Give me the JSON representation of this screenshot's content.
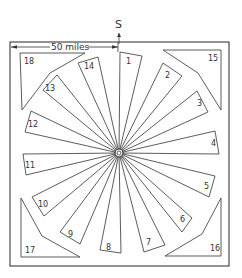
{
  "diagram": {
    "north_label": "S",
    "scale_label": "50 miles",
    "center": [
      119,
      153
    ],
    "frame": {
      "x": 10,
      "y": 42,
      "w": 219,
      "h": 224
    },
    "sectors": [
      {
        "id": "1",
        "label": "1",
        "outer": [
          [
            120,
            52
          ],
          [
            142,
            56
          ]
        ],
        "label_pos": [
          126,
          64
        ]
      },
      {
        "id": "2",
        "label": "2",
        "outer": [
          [
            163,
            63
          ],
          [
            182,
            76
          ]
        ],
        "label_pos": [
          165,
          78
        ]
      },
      {
        "id": "3",
        "label": "3",
        "outer": [
          [
            197,
            91
          ],
          [
            208,
            112
          ]
        ],
        "label_pos": [
          197,
          106
        ]
      },
      {
        "id": "4",
        "label": "4",
        "outer": [
          [
            215,
            131
          ],
          [
            219,
            154
          ]
        ],
        "label_pos": [
          211,
          146
        ]
      },
      {
        "id": "5",
        "label": "5",
        "outer": [
          [
            215,
            176
          ],
          [
            209,
            197
          ]
        ],
        "label_pos": [
          204,
          189
        ]
      },
      {
        "id": "6",
        "label": "6",
        "outer": [
          [
            192,
            218
          ],
          [
            182,
            232
          ]
        ],
        "label_pos": [
          180,
          222
        ]
      },
      {
        "id": "7",
        "label": "7",
        "outer": [
          [
            165,
            245
          ],
          [
            144,
            252
          ]
        ],
        "label_pos": [
          146,
          245
        ]
      },
      {
        "id": "8",
        "label": "8",
        "outer": [
          [
            121,
            253
          ],
          [
            100,
            250
          ]
        ],
        "label_pos": [
          106,
          250
        ]
      },
      {
        "id": "9",
        "label": "9",
        "outer": [
          [
            80,
            244
          ],
          [
            60,
            232
          ]
        ],
        "label_pos": [
          68,
          237
        ]
      },
      {
        "id": "10",
        "label": "10",
        "outer": [
          [
            44,
            216
          ],
          [
            32,
            197
          ]
        ],
        "label_pos": [
          38,
          207
        ]
      },
      {
        "id": "11",
        "label": "11",
        "outer": [
          [
            26,
            175
          ],
          [
            23,
            154
          ]
        ],
        "label_pos": [
          25,
          168
        ]
      },
      {
        "id": "12",
        "label": "12",
        "outer": [
          [
            25,
            132
          ],
          [
            31,
            111
          ]
        ],
        "label_pos": [
          28,
          127
        ]
      },
      {
        "id": "13",
        "label": "13",
        "outer": [
          [
            43,
            90
          ],
          [
            57,
            75
          ]
        ],
        "label_pos": [
          45,
          91
        ]
      },
      {
        "id": "14",
        "label": "14",
        "outer": [
          [
            78,
            63
          ],
          [
            98,
            57
          ]
        ],
        "label_pos": [
          84,
          69
        ]
      }
    ],
    "corners": [
      {
        "id": "18",
        "label": "18",
        "points": [
          [
            20,
            53
          ],
          [
            85,
            53
          ],
          [
            50,
            73
          ],
          [
            22,
            110
          ]
        ],
        "label_pos": [
          24,
          64
        ]
      },
      {
        "id": "15",
        "label": "15",
        "points": [
          [
            163,
            50
          ],
          [
            221,
            50
          ],
          [
            221,
            110
          ],
          [
            198,
            73
          ]
        ],
        "label_pos": [
          208,
          61
        ]
      },
      {
        "id": "17",
        "label": "17",
        "points": [
          [
            21,
            198
          ],
          [
            21,
            257
          ],
          [
            80,
            257
          ],
          [
            42,
            236
          ]
        ],
        "label_pos": [
          25,
          253
        ]
      },
      {
        "id": "16",
        "label": "16",
        "points": [
          [
            221,
            198
          ],
          [
            221,
            256
          ],
          [
            165,
            256
          ],
          [
            202,
            234
          ]
        ],
        "label_pos": [
          210,
          251
        ]
      }
    ]
  }
}
